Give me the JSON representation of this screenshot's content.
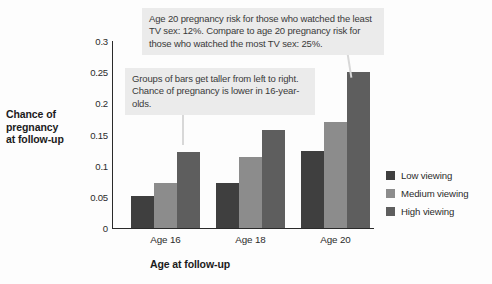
{
  "chart_data": {
    "type": "bar",
    "title": "",
    "categories": [
      "Age 16",
      "Age 18",
      "Age 20"
    ],
    "series": [
      {
        "name": "Low viewing",
        "values": [
          0.052,
          0.073,
          0.123
        ],
        "color": "#3f3f3f"
      },
      {
        "name": "Medium viewing",
        "values": [
          0.073,
          0.114,
          0.17
        ],
        "color": "#8c8c8c"
      },
      {
        "name": "High viewing",
        "values": [
          0.122,
          0.158,
          0.25
        ],
        "color": "#5e5e5e"
      }
    ],
    "xlabel": "Age at follow-up",
    "ylabel": "Chance of pregnancy at follow-up",
    "ylim": [
      0,
      0.3
    ],
    "yticks": [
      "0",
      "0.05",
      "0.1",
      "0.15",
      "0.2",
      "0.25",
      "0.3"
    ],
    "ytick_values": [
      0,
      0.05,
      0.1,
      0.15,
      0.2,
      0.25,
      0.3
    ],
    "grid": false,
    "legend_position": "right"
  },
  "axes": {
    "y_title_lines": [
      "Chance of",
      "pregnancy",
      "at follow-up"
    ],
    "x_title": "Age at follow-up"
  },
  "annotations": [
    {
      "id": "callout-1",
      "text": "Age 20 pregnancy risk for those who watched the least TV sex: 12%. Compare to age 20 pregnancy risk for those who watched the most TV sex: 25%."
    },
    {
      "id": "callout-2",
      "text": "Groups of bars get taller from left to right. Chance of pregnancy is lower in 16-year-olds."
    }
  ],
  "legend": {
    "items": [
      {
        "label": "Low viewing",
        "color": "#3f3f3f"
      },
      {
        "label": "Medium viewing",
        "color": "#8c8c8c"
      },
      {
        "label": "High viewing",
        "color": "#5e5e5e"
      }
    ]
  },
  "colors": {
    "background": "#fdfdfd",
    "axis": "#2a2a2a",
    "callout_background": "#ebebeb",
    "leader_line": "#d8d8d8",
    "text": "#2b2b2b"
  }
}
